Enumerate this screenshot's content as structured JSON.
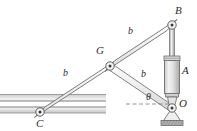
{
  "figure": {
    "type": "mechanism-diagram",
    "background": "#ffffff",
    "line_color": "#6e6e6e",
    "label_color": "#2b2b2b",
    "fill_light": "#f1f1f1",
    "fill_mid": "#d8d8d8",
    "fill_dark": "#b8b8b8"
  },
  "labels": {
    "point_b": "B",
    "point_g": "G",
    "point_c": "C",
    "point_o": "O",
    "cylinder_a": "A",
    "dim_upper": "b",
    "dim_lower_left": "b",
    "dim_link": "b",
    "angle_theta": "θ"
  },
  "geometry": {
    "points": {
      "B": [
        172,
        25
      ],
      "G": [
        110,
        66
      ],
      "C": [
        40,
        112
      ],
      "O": [
        172,
        108
      ]
    },
    "label_positions": {
      "B": [
        175,
        6
      ],
      "G": [
        97,
        46
      ],
      "C": [
        36,
        119
      ],
      "O": [
        178,
        99
      ],
      "A": [
        181,
        66
      ],
      "b_upper": [
        129,
        27
      ],
      "b_lower_left": [
        63,
        69
      ],
      "b_link": [
        141,
        70
      ],
      "theta": [
        146,
        93
      ]
    },
    "slot": {
      "y_top_band": 96,
      "y_gap": 104,
      "y_bottom_band": 112,
      "x_start": 0,
      "x_end": 105
    },
    "cylinder": {
      "x_center": 172,
      "rod_top": 28,
      "cap_top": 56,
      "body_top": 60,
      "body_bottom": 95,
      "body_width": 15
    },
    "ground": {
      "x": 162,
      "y": 121,
      "width": 22,
      "height": 5
    },
    "angle_reference_line": {
      "x_start": 128,
      "x_end": 172,
      "y": 104,
      "dashed": true
    }
  }
}
